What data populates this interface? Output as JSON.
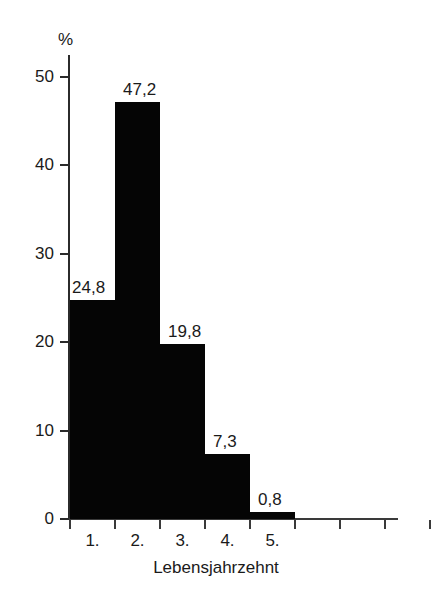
{
  "chart_data": {
    "type": "bar",
    "title": "",
    "subtitle": "",
    "categories": [
      "1.",
      "2.",
      "3.",
      "4.",
      "5."
    ],
    "values": [
      24.8,
      47.2,
      19.8,
      7.3,
      0.8
    ],
    "value_labels": [
      "24,8",
      "47,2",
      "19,8",
      "7,3",
      "0,8"
    ],
    "xlabel": "Lebensjahrzehnt",
    "ylabel": "%",
    "ylim": [
      0,
      50
    ],
    "yticks": [
      0,
      10,
      20,
      30,
      40,
      50
    ],
    "ytick_labels": [
      "0",
      "10",
      "20",
      "30",
      "40",
      "50"
    ],
    "grid": false,
    "legend": null,
    "bar_color": "#050505",
    "axis_color": "#2b2b2b",
    "background": "#ffffff",
    "extra_unlabeled_xticks": 4
  },
  "axis": {
    "unit_label": "%",
    "x_title": "Lebensjahrzehnt"
  }
}
